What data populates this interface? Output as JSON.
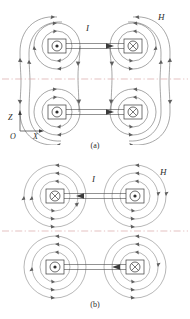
{
  "figure": {
    "title_none": "",
    "panels": [
      {
        "id": "a",
        "caption": "(a)",
        "labels": {
          "current": "I",
          "field": "H"
        },
        "axes": {
          "z": "Z",
          "origin": "O",
          "x": "X"
        },
        "conductors": [
          {
            "position": "top-left",
            "direction": "out-of-page",
            "symbol": "dot"
          },
          {
            "position": "top-right",
            "direction": "into-page",
            "symbol": "cross"
          },
          {
            "position": "bottom-left",
            "direction": "out-of-page",
            "symbol": "dot"
          },
          {
            "position": "bottom-right",
            "direction": "into-page",
            "symbol": "cross"
          }
        ],
        "current_arrows": [
          {
            "pair": "top",
            "points": "right"
          },
          {
            "pair": "bottom",
            "points": "right"
          }
        ],
        "field_pattern": "anti-parallel-pairs-merged-outer-envelope",
        "symmetry_line": "horizontal dash-dot"
      },
      {
        "id": "b",
        "caption": "(b)",
        "labels": {
          "current": "I",
          "field": "H"
        },
        "conductors": [
          {
            "position": "top-left",
            "direction": "into-page",
            "symbol": "cross"
          },
          {
            "position": "top-right",
            "direction": "out-of-page",
            "symbol": "dot"
          },
          {
            "position": "bottom-left",
            "direction": "out-of-page",
            "symbol": "dot"
          },
          {
            "position": "bottom-right",
            "direction": "into-page",
            "symbol": "cross"
          }
        ],
        "current_arrows": [
          {
            "pair": "top",
            "points": "left"
          },
          {
            "pair": "bottom",
            "points": "left"
          }
        ],
        "field_pattern": "concentric-rings-around-each-conductor",
        "symmetry_line": "horizontal dash-dot"
      }
    ],
    "colors": {
      "field_line": "#6b6b6b",
      "conductor_outline": "#2e2e2e",
      "symmetry_line": "#d9a6a6",
      "text": "#2b2b2b",
      "background": "#ffffff"
    }
  }
}
